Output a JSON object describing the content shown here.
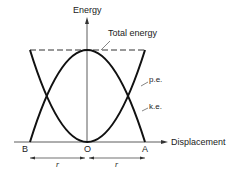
{
  "diagram": {
    "y_axis_label": "Energy",
    "x_axis_label": "Displacement",
    "curves": [
      {
        "name": "Total energy",
        "style": "dashed",
        "shape": "constant"
      },
      {
        "name": "p.e.",
        "style": "solid",
        "shape": "parabola (minimum at O)"
      },
      {
        "name": "k.e.",
        "style": "solid",
        "shape": "inverted parabola (maximum at O)"
      }
    ],
    "labels": {
      "total_energy": "Total energy",
      "pe": "p.e.",
      "ke": "k.e.",
      "point_b": "B",
      "point_o": "O",
      "point_a": "A",
      "r_left": "r",
      "r_right": "r"
    }
  }
}
